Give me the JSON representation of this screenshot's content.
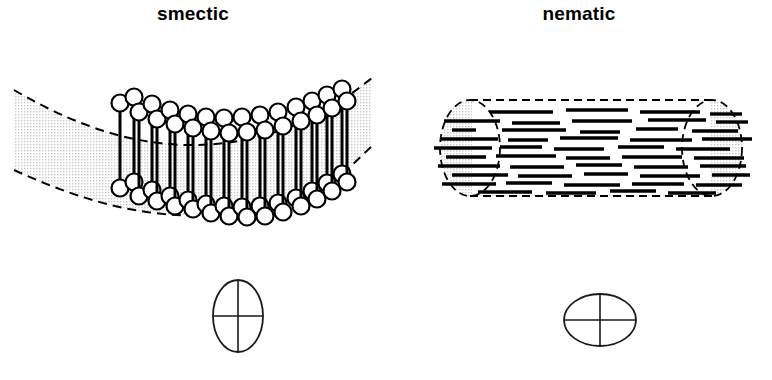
{
  "figure": {
    "title_smectic": "smectic",
    "title_nematic": "nematic",
    "background_color": "#ffffff",
    "ink_color": "#000000",
    "stipple_color": "#d8d8d8"
  },
  "panels": [
    {
      "id": "smectic",
      "label": "smectic",
      "label_x": 193,
      "label_y": 16,
      "description": "Curved smectic layer: rod molecules with spherical heads aligned normal to a bent layer, inside a dashed stippled band",
      "band": {
        "top_path": "M 14,90 C 110,146 210,170 330,110 L 372,78",
        "bottom_path": "M 14,170 C 110,214 210,238 330,186 L 372,146",
        "dashed": true,
        "dash_pattern": "9,6"
      },
      "molecule_count": 34,
      "molecules": [
        {
          "x": 120,
          "top": 103,
          "bottom": 188,
          "r": 8.5
        },
        {
          "x": 134,
          "top": 97,
          "bottom": 182,
          "r": 8.5
        },
        {
          "x": 139,
          "top": 112,
          "bottom": 196,
          "r": 8.5
        },
        {
          "x": 152,
          "top": 104,
          "bottom": 190,
          "r": 8.5
        },
        {
          "x": 157,
          "top": 119,
          "bottom": 201,
          "r": 8.5
        },
        {
          "x": 170,
          "top": 110,
          "bottom": 196,
          "r": 8.5
        },
        {
          "x": 175,
          "top": 124,
          "bottom": 206,
          "r": 8.5
        },
        {
          "x": 188,
          "top": 114,
          "bottom": 200,
          "r": 8.5
        },
        {
          "x": 193,
          "top": 128,
          "bottom": 209,
          "r": 8.5
        },
        {
          "x": 206,
          "top": 117,
          "bottom": 204,
          "r": 8.5
        },
        {
          "x": 211,
          "top": 131,
          "bottom": 213,
          "r": 8.5
        },
        {
          "x": 224,
          "top": 118,
          "bottom": 206,
          "r": 8.5
        },
        {
          "x": 229,
          "top": 133,
          "bottom": 216,
          "r": 8.5
        },
        {
          "x": 242,
          "top": 117,
          "bottom": 207,
          "r": 8.5
        },
        {
          "x": 247,
          "top": 132,
          "bottom": 217,
          "r": 8.5
        },
        {
          "x": 260,
          "top": 115,
          "bottom": 206,
          "r": 8.5
        },
        {
          "x": 265,
          "top": 130,
          "bottom": 216,
          "r": 8.5
        },
        {
          "x": 278,
          "top": 112,
          "bottom": 203,
          "r": 8.5
        },
        {
          "x": 283,
          "top": 126,
          "bottom": 212,
          "r": 8.5
        },
        {
          "x": 296,
          "top": 107,
          "bottom": 198,
          "r": 8.5
        },
        {
          "x": 301,
          "top": 121,
          "bottom": 206,
          "r": 8.5
        },
        {
          "x": 312,
          "top": 101,
          "bottom": 191,
          "r": 8.5
        },
        {
          "x": 317,
          "top": 115,
          "bottom": 199,
          "r": 8.5
        },
        {
          "x": 327,
          "top": 95,
          "bottom": 183,
          "r": 8.5
        },
        {
          "x": 332,
          "top": 108,
          "bottom": 191,
          "r": 8.5
        },
        {
          "x": 342,
          "top": 89,
          "bottom": 174,
          "r": 8.5
        },
        {
          "x": 347,
          "top": 101,
          "bottom": 182,
          "r": 8.5
        }
      ],
      "symbol": {
        "name": "vertical-ellipse-cross",
        "cx": 238,
        "cy": 316,
        "rx": 25,
        "ry": 36,
        "cross": true
      }
    },
    {
      "id": "nematic",
      "label": "nematic",
      "label_x": 579,
      "label_y": 16,
      "description": "Nematic cylinder: dashed stippled cylinder with rod molecules aligned along the axis but without positional order",
      "cylinder": {
        "left_cap_cx": 470,
        "right_cap_cx": 712,
        "cap_rx": 30,
        "cap_ry": 48,
        "cy": 148,
        "top_y": 100,
        "bottom_y": 196,
        "dashed": true,
        "dash_pattern": "8,5"
      },
      "rods": [
        {
          "x1": 490,
          "x2": 553,
          "y": 112
        },
        {
          "x1": 566,
          "x2": 628,
          "y": 110
        },
        {
          "x1": 640,
          "x2": 700,
          "y": 112
        },
        {
          "x1": 710,
          "x2": 742,
          "y": 114
        },
        {
          "x1": 444,
          "x2": 500,
          "y": 121
        },
        {
          "x1": 512,
          "x2": 560,
          "y": 123
        },
        {
          "x1": 572,
          "x2": 632,
          "y": 121
        },
        {
          "x1": 648,
          "x2": 706,
          "y": 120
        },
        {
          "x1": 716,
          "x2": 748,
          "y": 122
        },
        {
          "x1": 452,
          "x2": 476,
          "y": 130
        },
        {
          "x1": 502,
          "x2": 566,
          "y": 130
        },
        {
          "x1": 580,
          "x2": 620,
          "y": 132
        },
        {
          "x1": 636,
          "x2": 678,
          "y": 129
        },
        {
          "x1": 692,
          "x2": 738,
          "y": 131
        },
        {
          "x1": 440,
          "x2": 498,
          "y": 139
        },
        {
          "x1": 508,
          "x2": 548,
          "y": 140
        },
        {
          "x1": 560,
          "x2": 618,
          "y": 138
        },
        {
          "x1": 630,
          "x2": 692,
          "y": 140
        },
        {
          "x1": 702,
          "x2": 752,
          "y": 139
        },
        {
          "x1": 434,
          "x2": 492,
          "y": 148
        },
        {
          "x1": 500,
          "x2": 542,
          "y": 147
        },
        {
          "x1": 554,
          "x2": 604,
          "y": 149
        },
        {
          "x1": 618,
          "x2": 664,
          "y": 147
        },
        {
          "x1": 676,
          "x2": 730,
          "y": 149
        },
        {
          "x1": 446,
          "x2": 486,
          "y": 157
        },
        {
          "x1": 496,
          "x2": 556,
          "y": 156
        },
        {
          "x1": 566,
          "x2": 610,
          "y": 158
        },
        {
          "x1": 622,
          "x2": 682,
          "y": 157
        },
        {
          "x1": 694,
          "x2": 744,
          "y": 158
        },
        {
          "x1": 438,
          "x2": 500,
          "y": 166
        },
        {
          "x1": 510,
          "x2": 564,
          "y": 167
        },
        {
          "x1": 576,
          "x2": 622,
          "y": 165
        },
        {
          "x1": 634,
          "x2": 688,
          "y": 167
        },
        {
          "x1": 700,
          "x2": 746,
          "y": 166
        },
        {
          "x1": 452,
          "x2": 508,
          "y": 175
        },
        {
          "x1": 518,
          "x2": 572,
          "y": 176
        },
        {
          "x1": 584,
          "x2": 628,
          "y": 174
        },
        {
          "x1": 640,
          "x2": 700,
          "y": 176
        },
        {
          "x1": 712,
          "x2": 750,
          "y": 175
        },
        {
          "x1": 442,
          "x2": 496,
          "y": 184
        },
        {
          "x1": 506,
          "x2": 552,
          "y": 183
        },
        {
          "x1": 564,
          "x2": 620,
          "y": 185
        },
        {
          "x1": 632,
          "x2": 684,
          "y": 184
        },
        {
          "x1": 696,
          "x2": 742,
          "y": 185
        },
        {
          "x1": 478,
          "x2": 532,
          "y": 192
        },
        {
          "x1": 546,
          "x2": 596,
          "y": 193
        },
        {
          "x1": 610,
          "x2": 656,
          "y": 191
        },
        {
          "x1": 668,
          "x2": 716,
          "y": 193
        }
      ],
      "symbol": {
        "name": "horizontal-ellipse-cross",
        "cx": 600,
        "cy": 320,
        "rx": 36,
        "ry": 26,
        "cross": true
      }
    }
  ]
}
